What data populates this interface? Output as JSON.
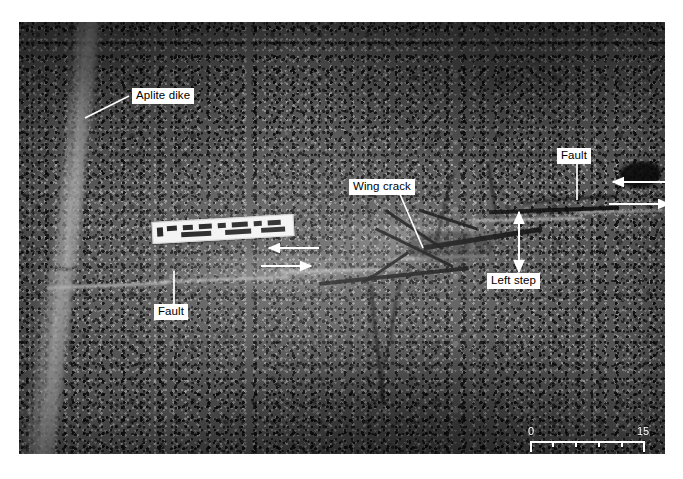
{
  "figure": {
    "type": "field-photograph",
    "caption": ""
  },
  "photo": {
    "description": "Grayscale outcrop photograph of speckled granite cut by a sub-horizontal fault trace, with a light aplite dike on the left offset across the fault",
    "ruler": {
      "name": "photo-scale-ruler",
      "description": "white field ruler lying on the outcrop"
    }
  },
  "labels": [
    {
      "id": "aplite-dike",
      "text": "Aplite dike"
    },
    {
      "id": "wing-crack",
      "text": "Wing crack"
    },
    {
      "id": "fault-right",
      "text": "Fault"
    },
    {
      "id": "fault-left",
      "text": "Fault"
    },
    {
      "id": "left-step",
      "text": "Left step"
    }
  ],
  "shear_arrows": [
    {
      "id": "shear-pair-left",
      "upper_direction": "left",
      "lower_direction": "right",
      "sense": "left-lateral"
    },
    {
      "id": "shear-pair-right",
      "upper_direction": "left",
      "lower_direction": "right",
      "sense": "left-lateral"
    }
  ],
  "step_arrow": {
    "id": "left-step-double-arrow",
    "style": "double-headed vertical arrow",
    "measures": "width of the left step"
  },
  "scale_bar": {
    "start_label": "0",
    "end_label": "15",
    "unit_label": "(cm)",
    "minor_ticks": 4,
    "color": "#ffffff"
  },
  "colors": {
    "label_background": "#ffffff",
    "label_text": "#000000",
    "annotation_line": "#ffffff",
    "page_background": "#ffffff"
  }
}
